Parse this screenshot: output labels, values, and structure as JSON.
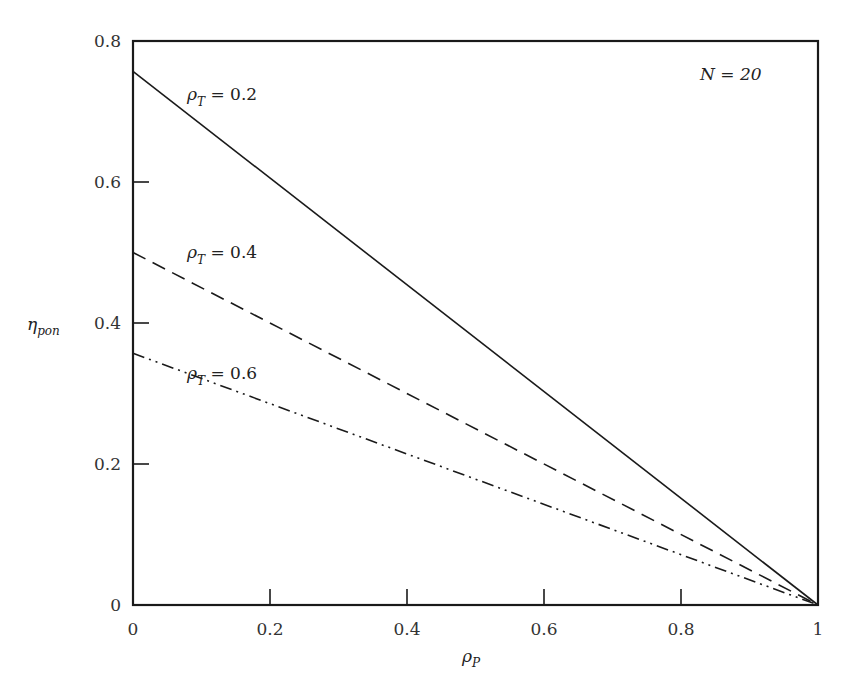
{
  "chart_data": {
    "type": "line",
    "title": "",
    "xlabel": "ρ_P",
    "ylabel": "η_pon",
    "xlim": [
      0,
      1
    ],
    "ylim": [
      0,
      0.8
    ],
    "xticks": [
      0,
      0.2,
      0.4,
      0.6,
      0.8,
      1
    ],
    "xtick_labels": [
      "0",
      "0.2",
      "0.4",
      "0.6",
      "0.8",
      "1"
    ],
    "yticks": [
      0,
      0.2,
      0.4,
      0.6,
      0.8
    ],
    "ytick_labels": [
      "0",
      "0.2",
      "0.4",
      "0.6",
      "0.8"
    ],
    "grid": false,
    "legend": "none (inline labels)",
    "annotations": [
      {
        "text": "N = 20",
        "position": "top-right"
      }
    ],
    "series": [
      {
        "name": "ρ_T = 0.2",
        "label_main": "ρ",
        "label_sub": "T",
        "label_rest": " = 0.2",
        "style": "solid",
        "x": [
          0,
          1
        ],
        "y": [
          0.757,
          0.0
        ]
      },
      {
        "name": "ρ_T = 0.4",
        "label_main": "ρ",
        "label_sub": "T",
        "label_rest": " = 0.4",
        "style": "dashed",
        "x": [
          0,
          1
        ],
        "y": [
          0.5,
          0.0
        ]
      },
      {
        "name": "ρ_T = 0.6",
        "label_main": "ρ",
        "label_sub": "T",
        "label_rest": " = 0.6",
        "style": "dash-dot-dot",
        "x": [
          0,
          1
        ],
        "y": [
          0.357,
          0.0
        ]
      }
    ]
  },
  "labels": {
    "x_main": "ρ",
    "x_sub": "P",
    "y_main": "η",
    "y_sub": "pon",
    "n_label": "N = 20"
  }
}
